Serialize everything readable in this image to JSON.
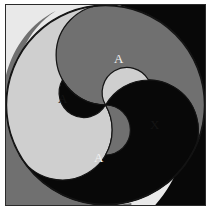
{
  "figure": {
    "kind": "triskelion-spiral",
    "frame": {
      "border_color": "#2b2b2b",
      "page_background": "#ffffff"
    },
    "palette": {
      "light": "#e9e9e9",
      "mid_light": "#cfcfcf",
      "mid_gray": "#707070",
      "black": "#080808",
      "label_light": "#f2f2f2",
      "label_dark": "#141414"
    },
    "regions": [
      {
        "id": "arm-gray",
        "fill_name": "mid_gray",
        "label": "A",
        "label_color_name": "label_light",
        "label_x": 118,
        "label_y": 59
      },
      {
        "id": "arm-light",
        "fill_name": "mid_light",
        "label": "A",
        "label_color_name": "label_dark",
        "label_x": 62,
        "label_y": 99
      },
      {
        "id": "arm-black",
        "fill_name": "black",
        "label": "A",
        "label_color_name": "label_light",
        "label_x": 98,
        "label_y": 158
      },
      {
        "id": "arm-white",
        "fill_name": "light",
        "label": "X",
        "label_color_name": "label_dark",
        "label_x": 154,
        "label_y": 125
      }
    ],
    "label_set": [
      "A",
      "A",
      "A",
      "X"
    ]
  }
}
